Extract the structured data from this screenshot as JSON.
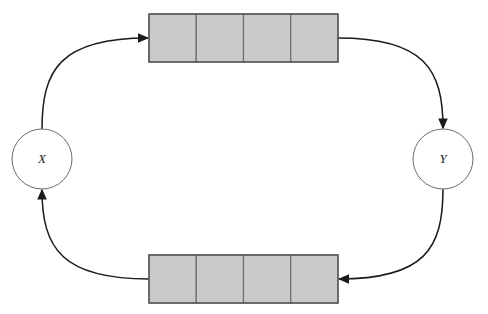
{
  "diagram": {
    "background_color": "#ffffff",
    "nodes": [
      {
        "id": "node-x",
        "label": "X",
        "cx": 42,
        "cy": 159,
        "r": 30,
        "fill": "#ffffff",
        "stroke": "#6b6b6b"
      },
      {
        "id": "node-y",
        "label": "Y",
        "cx": 443,
        "cy": 159,
        "r": 30,
        "fill": "#ffffff",
        "stroke": "#6b6b6b"
      }
    ],
    "queues": [
      {
        "id": "queue-top",
        "name": "top-queue",
        "x": 149,
        "y": 14,
        "width": 189,
        "height": 48,
        "cells": 4,
        "cell_fill": "#c9c9c9",
        "cell_stroke": "#6e6e6e"
      },
      {
        "id": "queue-bottom",
        "name": "bottom-queue",
        "x": 149,
        "y": 255,
        "width": 189,
        "height": 48,
        "cells": 4,
        "cell_fill": "#c9c9c9",
        "cell_stroke": "#6e6e6e"
      }
    ],
    "edges": [
      {
        "id": "edge-x-to-top-queue",
        "name": "edge-x-to-top-queue",
        "from": "node-x",
        "to": "queue-top",
        "path": "M 42 129 C 42 70 60 38 148 38",
        "arrow": "right",
        "arrow_at": [
          148,
          38
        ],
        "stroke": "#1a1a1a"
      },
      {
        "id": "edge-top-queue-to-y",
        "name": "edge-top-queue-to-y",
        "from": "queue-top",
        "to": "node-y",
        "path": "M 338 38 C 425 38 443 70 443 128",
        "arrow": "down",
        "arrow_at": [
          443,
          128
        ],
        "stroke": "#1a1a1a"
      },
      {
        "id": "edge-y-to-bottom-queue",
        "name": "edge-y-to-bottom-queue",
        "from": "node-y",
        "to": "queue-bottom",
        "path": "M 443 189 C 443 248 425 279 339 279",
        "arrow": "left",
        "arrow_at": [
          339,
          279
        ],
        "stroke": "#1a1a1a"
      },
      {
        "id": "edge-bottom-queue-to-x",
        "name": "edge-bottom-queue-to-x",
        "from": "queue-bottom",
        "to": "node-x",
        "path": "M 149 279 C 62 279 42 248 42 190",
        "arrow": "up",
        "arrow_at": [
          42,
          190
        ],
        "stroke": "#1a1a1a"
      }
    ]
  }
}
